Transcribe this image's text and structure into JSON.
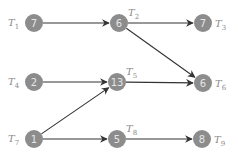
{
  "diagram": {
    "type": "task-dependency-graph",
    "colors": {
      "node": "#8c8c8c",
      "node_text": "#e6e6e6",
      "label": "#8a8a8a",
      "edge": "#333333"
    },
    "nodes": [
      {
        "id": "T1",
        "label": "T",
        "sub": "1",
        "value": "7",
        "x": 34,
        "y": 23,
        "label_side": "left"
      },
      {
        "id": "T2",
        "label": "T",
        "sub": "2",
        "value": "6",
        "x": 119,
        "y": 23,
        "label_side": "top-right"
      },
      {
        "id": "T3",
        "label": "T",
        "sub": "3",
        "value": "7",
        "x": 203,
        "y": 23,
        "label_side": "right"
      },
      {
        "id": "T4",
        "label": "T",
        "sub": "4",
        "value": "2",
        "x": 34,
        "y": 82,
        "label_side": "left"
      },
      {
        "id": "T5",
        "label": "T",
        "sub": "5",
        "value": "13",
        "x": 117,
        "y": 82,
        "label_side": "top-right"
      },
      {
        "id": "T6",
        "label": "T",
        "sub": "6",
        "value": "6",
        "x": 203,
        "y": 83,
        "label_side": "right"
      },
      {
        "id": "T7",
        "label": "T",
        "sub": "7",
        "value": "1",
        "x": 34,
        "y": 139,
        "label_side": "left"
      },
      {
        "id": "T8",
        "label": "T",
        "sub": "8",
        "value": "5",
        "x": 117,
        "y": 139,
        "label_side": "top-right"
      },
      {
        "id": "T9",
        "label": "T",
        "sub": "9",
        "value": "8",
        "x": 202,
        "y": 139,
        "label_side": "right"
      }
    ],
    "edges": [
      {
        "from": "T1",
        "to": "T2"
      },
      {
        "from": "T2",
        "to": "T3"
      },
      {
        "from": "T2",
        "to": "T6"
      },
      {
        "from": "T4",
        "to": "T5"
      },
      {
        "from": "T5",
        "to": "T6"
      },
      {
        "from": "T7",
        "to": "T5"
      },
      {
        "from": "T7",
        "to": "T8"
      },
      {
        "from": "T8",
        "to": "T9"
      }
    ]
  }
}
